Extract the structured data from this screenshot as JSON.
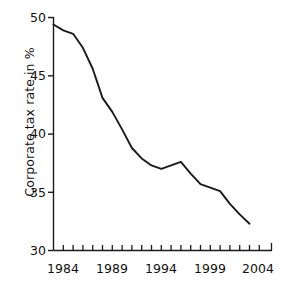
{
  "chart_data": {
    "type": "line",
    "title": "",
    "subtitle": "",
    "xlabel": "",
    "ylabel": "Corporate tax rate in %",
    "xlim": [
      1983,
      2004.5
    ],
    "ylim": [
      30,
      50
    ],
    "grid": false,
    "legend": null,
    "annotations": [],
    "yticks": [
      30,
      35,
      40,
      45,
      50
    ],
    "ytick_labels": [
      "30",
      "35",
      "40",
      "45",
      "50"
    ],
    "xticks": [
      1984,
      1989,
      1994,
      1999,
      2004
    ],
    "xtick_labels": [
      "1984",
      "1989",
      "1994",
      "1999",
      "2004"
    ],
    "x_minor_tick_interval": 1,
    "line_color": "#1a1a1a",
    "axis_color": "#1a1a1a",
    "background_color": "#ffffff",
    "x": [
      1983,
      1984,
      1985,
      1986,
      1987,
      1988,
      1989,
      1990,
      1991,
      1992,
      1993,
      1994,
      1995,
      1996,
      1997,
      1998,
      1999,
      2000,
      2001,
      2002,
      2003
    ],
    "values": [
      49.4,
      48.9,
      48.6,
      47.4,
      45.6,
      43.1,
      41.9,
      40.4,
      38.8,
      37.9,
      37.3,
      37.0,
      37.3,
      37.6,
      36.6,
      35.7,
      35.4,
      35.1,
      34.0,
      33.1,
      32.3
    ],
    "series": [
      {
        "name": "Corporate tax rate",
        "values": [
          49.4,
          48.9,
          48.6,
          47.4,
          45.6,
          43.1,
          41.9,
          40.4,
          38.8,
          37.9,
          37.3,
          37.0,
          37.3,
          37.6,
          36.6,
          35.7,
          35.4,
          35.1,
          34.0,
          33.1,
          32.3
        ]
      }
    ]
  },
  "axis": {
    "y_ticks": [
      {
        "label": "50"
      },
      {
        "label": "45"
      },
      {
        "label": "40"
      },
      {
        "label": "35"
      },
      {
        "label": "30"
      }
    ],
    "x_ticks": [
      {
        "label": "1984"
      },
      {
        "label": "1989"
      },
      {
        "label": "1994"
      },
      {
        "label": "1999"
      },
      {
        "label": "2004"
      }
    ],
    "y_axis_title": "Corporate tax rate in %"
  }
}
